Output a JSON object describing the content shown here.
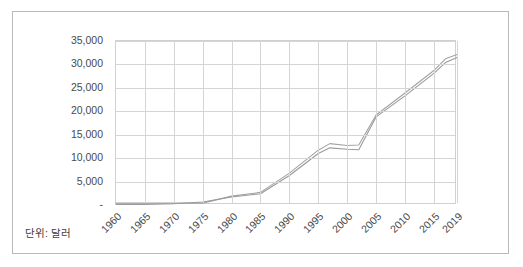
{
  "card": {
    "unit_note": "단위: 달러"
  },
  "chart_data": {
    "type": "line",
    "title": "",
    "subtitle": "",
    "xlabel": "",
    "ylabel": "",
    "unit_note": "단위: 달러",
    "grid": true,
    "legend": false,
    "legend_position": "none",
    "xlim": [
      1960,
      2019
    ],
    "ylim": [
      0,
      35000
    ],
    "ytick_values": [
      0,
      5000,
      10000,
      15000,
      20000,
      25000,
      30000,
      35000
    ],
    "ytick_labels": [
      "-",
      "5,000",
      "10,000",
      "15,000",
      "20,000",
      "25,000",
      "30,000",
      "35,000"
    ],
    "xtick_values": [
      1960,
      1965,
      1970,
      1975,
      1980,
      1985,
      1990,
      1995,
      2000,
      2005,
      2010,
      2015,
      2019
    ],
    "xtick_labels": [
      "1960",
      "1965",
      "1970",
      "1975",
      "1980",
      "1985",
      "1990",
      "1995",
      "2000",
      "2005",
      "2010",
      "2015",
      "2019"
    ],
    "line_color_a": "#a3a3a3",
    "line_color_b": "#9a9a9a",
    "grid_color": "#d5d5d5",
    "axis_color": "#d0d0d0",
    "text_color": "#4a4a4a",
    "x": [
      1960,
      1965,
      1970,
      1975,
      1980,
      1985,
      1990,
      1995,
      1997,
      2000,
      2002,
      2005,
      2010,
      2015,
      2017,
      2019
    ],
    "series": [
      {
        "name": "A",
        "values": [
          400,
          400,
          400,
          400,
          1900,
          2700,
          6800,
          11700,
          13100,
          12700,
          12800,
          19200,
          23900,
          28700,
          31200,
          32100
        ]
      },
      {
        "name": "B",
        "values": [
          100,
          120,
          280,
          650,
          1700,
          2400,
          6300,
          11000,
          12200,
          11900,
          11800,
          18800,
          23300,
          28100,
          30400,
          31500
        ]
      }
    ]
  }
}
